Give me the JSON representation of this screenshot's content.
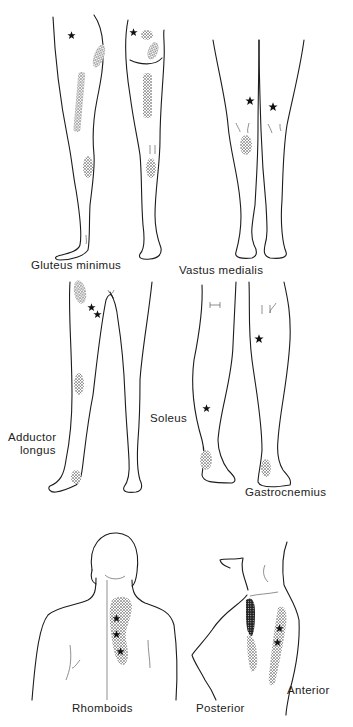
{
  "figure": {
    "background": "#ffffff",
    "ink_color": "#1c1c1c",
    "panels": [
      {
        "id": "gluteus-minimus",
        "label": "Gluteus  minimus",
        "view": "lateral and posterior leg",
        "trigger_points": 2
      },
      {
        "id": "vastus-medialis",
        "label": "Vastus  medialis",
        "view": "anterior legs",
        "trigger_points": 2
      },
      {
        "id": "adductor-longus",
        "label_line1": "Adductor",
        "label_line2": "longus",
        "view": "anterior legs",
        "trigger_points": 2
      },
      {
        "id": "soleus",
        "label": "Soleus",
        "view": "posterior leg",
        "trigger_points": 1
      },
      {
        "id": "gastrocnemius",
        "label": "Gastrocnemius",
        "view": "posterior leg",
        "trigger_points": 1
      },
      {
        "id": "rhomboids",
        "label": "Rhomboids",
        "view": "posterior upper back",
        "trigger_points": 3
      },
      {
        "id": "scalene-posterior",
        "label": "Posterior",
        "view": "lateral torso",
        "trigger_points": 3
      },
      {
        "id": "scalene-anterior",
        "label": "Anterior",
        "view": "lateral torso",
        "trigger_points": 2
      }
    ],
    "legend": {
      "star_icon": "trigger point",
      "stippled_area": "referred pain zone"
    }
  }
}
